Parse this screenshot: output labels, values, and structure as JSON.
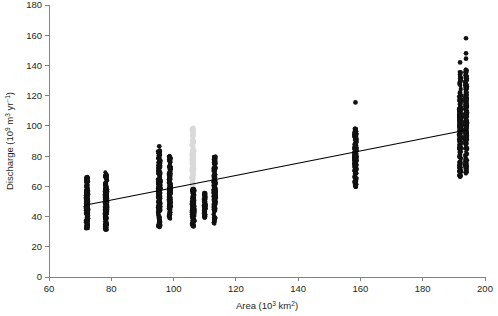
{
  "chart_data": {
    "type": "scatter",
    "title": "",
    "xlabel": "Area (10^3 km^2)",
    "ylabel": "Discharge (10^9 m^3 yr^-1)",
    "xlabel_parts": {
      "prefix": "Area (10",
      "sup1": "3",
      "mid": " km",
      "sup2": "2",
      "suffix": ")"
    },
    "ylabel_parts": {
      "prefix": "Discharge (10",
      "sup1": "9",
      "mid": " m",
      "sup2": "3",
      "mid2": " yr",
      "sup3": "−1",
      "suffix": ")"
    },
    "xlim": [
      60,
      200
    ],
    "ylim": [
      0,
      180
    ],
    "xticks": [
      60,
      80,
      100,
      120,
      140,
      160,
      180,
      200
    ],
    "yticks": [
      0,
      20,
      40,
      60,
      80,
      100,
      120,
      140,
      160,
      180
    ],
    "grid": false,
    "legend": "none",
    "trend_line": {
      "name": "linear regression",
      "x_start": 71.5,
      "y_start": 47.5,
      "x_end": 194.5,
      "y_end": 97.5,
      "color": "#000000"
    },
    "series": [
      {
        "name": "cluster-72",
        "color": "#111111",
        "x": 72.2,
        "x_jitter": 0.45,
        "y_min": 32.0,
        "y_max": 66.5,
        "n": 170,
        "outliers": []
      },
      {
        "name": "cluster-78",
        "color": "#111111",
        "x": 78.3,
        "x_jitter": 0.45,
        "y_min": 31.0,
        "y_max": 69.5,
        "n": 170,
        "outliers": []
      },
      {
        "name": "cluster-95",
        "color": "#111111",
        "x": 95.4,
        "x_jitter": 0.5,
        "y_min": 32.5,
        "y_max": 84.0,
        "n": 200,
        "outliers": [
          86.5
        ]
      },
      {
        "name": "cluster-99",
        "color": "#111111",
        "x": 98.8,
        "x_jitter": 0.4,
        "y_min": 38.5,
        "y_max": 80.5,
        "n": 150,
        "outliers": []
      },
      {
        "name": "cluster-106-light",
        "color": "#d9d9d9",
        "x": 106.2,
        "x_jitter": 0.5,
        "y_min": 57.0,
        "y_max": 99.0,
        "n": 150,
        "outliers": []
      },
      {
        "name": "cluster-106-dark",
        "color": "#111111",
        "x": 106.3,
        "x_jitter": 0.5,
        "y_min": 33.0,
        "y_max": 58.5,
        "n": 140,
        "outliers": []
      },
      {
        "name": "cluster-110",
        "color": "#111111",
        "x": 110.0,
        "x_jitter": 0.35,
        "y_min": 39.0,
        "y_max": 56.0,
        "n": 90,
        "outliers": []
      },
      {
        "name": "cluster-113",
        "color": "#111111",
        "x": 113.2,
        "x_jitter": 0.45,
        "y_min": 35.0,
        "y_max": 80.0,
        "n": 170,
        "outliers": []
      },
      {
        "name": "cluster-158",
        "color": "#111111",
        "x": 158.4,
        "x_jitter": 0.45,
        "y_min": 59.0,
        "y_max": 98.5,
        "n": 200,
        "outliers": [
          115.5
        ]
      },
      {
        "name": "cluster-192",
        "color": "#111111",
        "x": 192.0,
        "x_jitter": 0.4,
        "y_min": 66.0,
        "y_max": 136.0,
        "n": 230,
        "outliers": [
          142.0
        ]
      },
      {
        "name": "cluster-194",
        "color": "#111111",
        "x": 193.9,
        "x_jitter": 0.4,
        "y_min": 68.0,
        "y_max": 137.5,
        "n": 230,
        "outliers": [
          158.0,
          148.0,
          144.5
        ]
      }
    ]
  },
  "axes": {
    "x_tick_labels": [
      "60",
      "80",
      "100",
      "120",
      "140",
      "160",
      "180",
      "200"
    ],
    "y_tick_labels": [
      "0",
      "20",
      "40",
      "60",
      "80",
      "100",
      "120",
      "140",
      "160",
      "180"
    ]
  },
  "colors": {
    "axis": "#808285",
    "text": "#231f20",
    "point_dark": "#111111",
    "point_light": "#d9d9d9",
    "trend": "#000000",
    "background": "#ffffff"
  }
}
